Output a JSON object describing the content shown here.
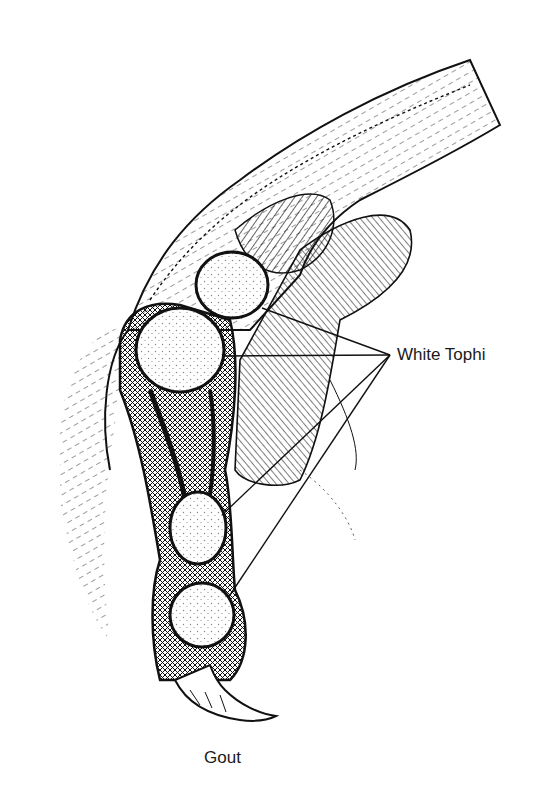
{
  "figure": {
    "caption": "Gout",
    "callout_label": "White Tophi",
    "callout_anchor": {
      "x": 390,
      "y": 355
    },
    "tophi": [
      {
        "name": "tophus-1",
        "cx": 232,
        "cy": 285,
        "rx": 36,
        "ry": 33
      },
      {
        "name": "tophus-2",
        "cx": 180,
        "cy": 350,
        "rx": 44,
        "ry": 42
      },
      {
        "name": "tophus-3",
        "cx": 198,
        "cy": 528,
        "rx": 28,
        "ry": 36
      },
      {
        "name": "tophus-4",
        "cx": 202,
        "cy": 615,
        "rx": 32,
        "ry": 32
      }
    ],
    "leader_targets": [
      {
        "x": 262,
        "y": 308
      },
      {
        "x": 225,
        "y": 356
      },
      {
        "x": 222,
        "y": 515
      },
      {
        "x": 228,
        "y": 598
      }
    ],
    "colors": {
      "ink": "#111111",
      "paper": "#ffffff"
    }
  }
}
